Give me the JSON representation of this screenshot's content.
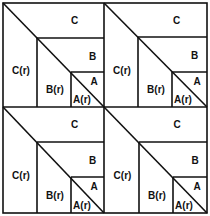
{
  "diagram": {
    "title": "",
    "colors": {
      "line": "#111111",
      "background": "#ffffff"
    },
    "outer": {
      "x": 3,
      "y": 3,
      "w": 204,
      "h": 210
    },
    "dividers": {
      "vx": 104,
      "hy": 107
    },
    "quadrants": [
      {
        "id": "top-left",
        "x0": 3,
        "y0": 3,
        "x1": 104,
        "y1": 107,
        "bx": 37,
        "by": 38,
        "ax": 71,
        "ay": 72,
        "labels": {
          "C": "C",
          "B": "B",
          "A": "A",
          "Cr": "C(r)",
          "Br": "B(r)",
          "Ar": "A(r)"
        }
      },
      {
        "id": "top-right",
        "x0": 104,
        "y0": 3,
        "x1": 207,
        "y1": 107,
        "bx": 138,
        "by": 37,
        "ax": 172,
        "ay": 72,
        "labels": {
          "C": "C",
          "B": "B",
          "A": "A",
          "Cr": "C(r)",
          "Br": "B(r)",
          "Ar": "A(r)"
        }
      },
      {
        "id": "bottom-left",
        "x0": 3,
        "y0": 107,
        "x1": 104,
        "y1": 213,
        "bx": 37,
        "by": 142,
        "ax": 71,
        "ay": 177,
        "labels": {
          "C": "C",
          "B": "B",
          "A": "A",
          "Cr": "C(r)",
          "Br": "B(r)",
          "Ar": "A(r)"
        }
      },
      {
        "id": "bottom-right",
        "x0": 104,
        "y0": 107,
        "x1": 207,
        "y1": 213,
        "bx": 139,
        "by": 142,
        "ax": 173,
        "ay": 177,
        "labels": {
          "C": "C",
          "B": "B",
          "A": "A",
          "Cr": "C(r)",
          "Br": "B(r)",
          "Ar": "A(r)"
        }
      }
    ]
  }
}
